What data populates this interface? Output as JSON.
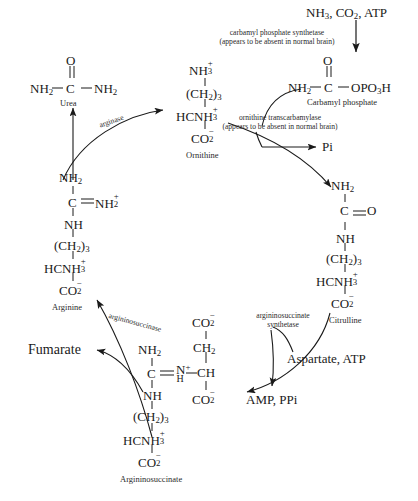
{
  "diagram": {
    "background": "#ffffff",
    "ink": "#1a1a1a"
  },
  "molecules": {
    "urea": {
      "name": "Urea",
      "top": "O",
      "line": "NH2 — C — NH2",
      "left_group": "NH",
      "left_sub": "2",
      "center": "C",
      "right_group": "NH",
      "right_sub": "2"
    },
    "ornithine": {
      "name": "Ornithine",
      "rows": [
        "NH3+",
        "(CH2)3",
        "HCNH3+",
        "CO2-"
      ]
    },
    "carbamyl_phosphate": {
      "name": "Carbamyl phosphate",
      "top": "O",
      "left_group": "NH",
      "left_sub": "2",
      "center": "C",
      "right_group": "OPO3H"
    },
    "citrulline": {
      "name": "Citrulline",
      "rows": [
        "NH2",
        "C=O",
        "NH",
        "(CH2)3",
        "HCNH3+",
        "CO2-"
      ]
    },
    "arginine": {
      "name": "Arginine",
      "rows": [
        "NH2",
        "C=NH2+",
        "NH",
        "(CH2)3",
        "HCNH3+",
        "CO2-"
      ]
    },
    "argininosuccinate": {
      "name": "Argininosuccinate",
      "rows": [
        "NH2",
        "C=N+H",
        "NH",
        "(CH2)3",
        "HCNH3+",
        "CO2-"
      ],
      "succinyl_rows": [
        "CO2-",
        "CH2",
        "CH",
        "CO2-"
      ]
    }
  },
  "substrates": {
    "nh3_co2_atp": "NH3, CO2, ATP",
    "pi": "Pi",
    "aspartate_atp": "Aspartate, ATP",
    "amp_ppi": "AMP, PPi",
    "fumarate": "Fumarate"
  },
  "enzymes": {
    "carbamyl_phosphate_synthetase": {
      "line1": "carbamyl phosphate synthetase",
      "line2": "(appears to be absent in normal brain)"
    },
    "ornithine_transcarbamylase": {
      "line1": "ornithine transcarbamylase",
      "line2": "(appears to be absent in normal brain)"
    },
    "argininosuccinate_synthetase": {
      "line1": "argininosuccinate",
      "line2": "synthetase"
    },
    "argininosuccinase": {
      "line1": "argininosuccinase"
    },
    "arginase": {
      "line1": "arginase"
    }
  }
}
